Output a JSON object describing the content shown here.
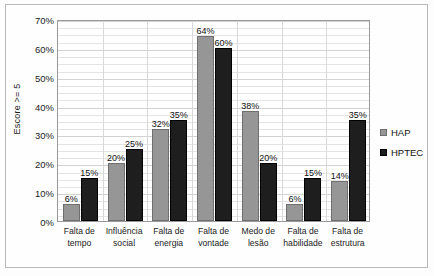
{
  "chart_data": {
    "type": "bar",
    "title": "",
    "xlabel": "",
    "ylabel": "Escore >= 5",
    "ylim": [
      0,
      70
    ],
    "y_ticks": [
      "0%",
      "10%",
      "20%",
      "30%",
      "40%",
      "50%",
      "60%",
      "70%"
    ],
    "y_tick_values": [
      0,
      10,
      20,
      30,
      40,
      50,
      60,
      70
    ],
    "y_tick_step": 10,
    "minor_gridline_step": 2.5,
    "grid": true,
    "legend_position": "right",
    "categories": [
      "Falta de tempo",
      "Influência social",
      "Falta de energia",
      "Falta de vontade",
      "Medo de lesão",
      "Falta de habilidade",
      "Falta de estrutura"
    ],
    "category_lines": [
      [
        "Falta de",
        "tempo"
      ],
      [
        "Influência",
        "social"
      ],
      [
        "Falta de",
        "energia"
      ],
      [
        "Falta de",
        "vontade"
      ],
      [
        "Medo de",
        "lesão"
      ],
      [
        "Falta de",
        "habilidade"
      ],
      [
        "Falta de",
        "estrutura"
      ]
    ],
    "series": [
      {
        "name": "HAP",
        "color": "#969696",
        "values": [
          6,
          20,
          32,
          64,
          38,
          6,
          14
        ],
        "labels": [
          "6%",
          "20%",
          "32%",
          "64%",
          "38%",
          "6%",
          "14%"
        ]
      },
      {
        "name": "HPTEC",
        "color": "#1e1e1e",
        "values": [
          15,
          25,
          35,
          60,
          20,
          15,
          35
        ],
        "labels": [
          "15%",
          "25%",
          "35%",
          "60%",
          "20%",
          "15%",
          "35%"
        ]
      }
    ]
  },
  "legend": {
    "items": [
      {
        "label": "HAP",
        "color": "#969696"
      },
      {
        "label": "HPTEC",
        "color": "#1e1e1e"
      }
    ]
  }
}
